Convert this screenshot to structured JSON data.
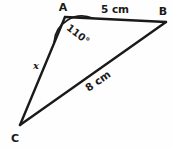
{
  "figure": {
    "kind": "triangle-diagram",
    "stroke_color": "#1a1a1a",
    "background_color": "#fefefe",
    "vertices": [
      {
        "name": "A",
        "label": "A",
        "x": 65,
        "y": 17,
        "label_x": 63,
        "label_y": 11
      },
      {
        "name": "B",
        "label": "B",
        "x": 166,
        "y": 22,
        "label_x": 163,
        "label_y": 15
      },
      {
        "name": "C",
        "label": "C",
        "x": 20,
        "y": 125,
        "label_x": 15,
        "label_y": 142
      }
    ],
    "sides": [
      {
        "name": "AB",
        "label": "5 cm",
        "from": "A",
        "to": "B",
        "label_x": 115,
        "label_y": 13,
        "rotation": 0
      },
      {
        "name": "CB",
        "label": "8 cm",
        "from": "C",
        "to": "B",
        "label_x": 100,
        "label_y": 84,
        "rotation": -35
      },
      {
        "name": "AC",
        "label": "x",
        "from": "A",
        "to": "C",
        "label_x": 36,
        "label_y": 69,
        "rotation": 0
      }
    ],
    "angles": [
      {
        "name": "angle-A",
        "label": "110°",
        "at_vertex": "A",
        "value": 110,
        "unit": "degrees",
        "arc_radius": 28,
        "label_x": 76,
        "label_y": 37,
        "label_rotation": 38
      }
    ]
  }
}
